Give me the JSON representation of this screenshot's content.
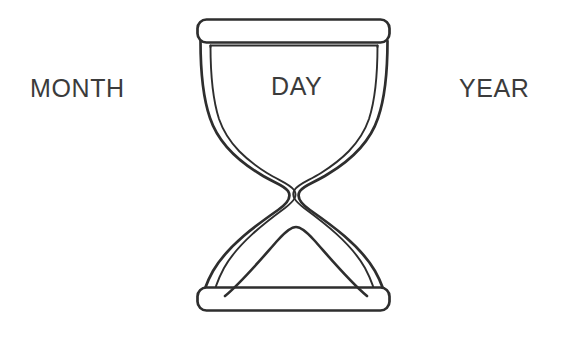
{
  "canvas": {
    "width": 567,
    "height": 345,
    "background_color": "#ffffff"
  },
  "illustration": {
    "name": "hourglass",
    "description": "Line-drawing hourglass with sand mound in lower bulb",
    "stroke_color": "#2e2e2e",
    "fill_color": "#ffffff",
    "stroke_width": 2.6,
    "inner_stroke_width": 1.9
  },
  "labels": {
    "month": {
      "text": "MONTH",
      "color": "#3b3b3b",
      "font_size": 25
    },
    "day": {
      "text": "DAY",
      "color": "#3b3b3b",
      "font_size": 25
    },
    "year": {
      "text": "YEAR",
      "color": "#3b3b3b",
      "font_size": 25
    }
  },
  "geometry": {
    "top_cap": {
      "left": 197,
      "right": 391,
      "top": 19,
      "bottom": 43,
      "corner_radius": 9
    },
    "bottom_cap": {
      "left": 197,
      "right": 391,
      "top": 287,
      "bottom": 310,
      "corner_radius": 9
    },
    "neck": {
      "left": 288,
      "right": 304,
      "y": 180
    },
    "sand_mound": {
      "peak_x": 296,
      "peak_y": 228,
      "base_left_x": 225,
      "base_right_x": 367,
      "base_y": 296
    }
  }
}
